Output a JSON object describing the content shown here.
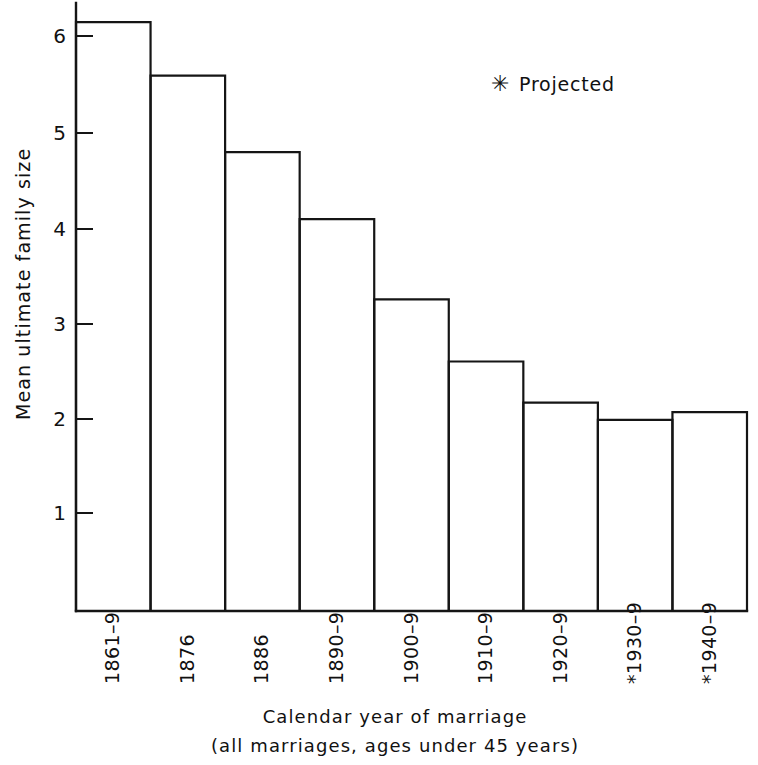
{
  "chart_data": {
    "type": "bar",
    "title": "",
    "xlabel": "Calendar year of marriage",
    "xlabel_sub": "(all marriages, ages under 45 years)",
    "ylabel": "Mean ultimate family size",
    "categories": [
      "1861–9",
      "1876",
      "1886",
      "1890–9",
      "1900–9",
      "1910–9",
      "1920–9",
      "*1930–9",
      "*1940–9"
    ],
    "values": [
      6.16,
      5.6,
      4.8,
      4.1,
      3.26,
      2.61,
      2.18,
      2.0,
      2.08
    ],
    "projected": [
      false,
      false,
      false,
      false,
      false,
      false,
      false,
      true,
      true
    ],
    "ylim": [
      0,
      6.5
    ],
    "yticks": [
      "1",
      "2",
      "3",
      "4",
      "5",
      "6"
    ],
    "ytick_values": [
      1,
      2,
      3,
      4,
      5,
      6
    ],
    "grid": false,
    "legend": {
      "position": "top-right",
      "marker": "asterisk-marker",
      "entries": [
        {
          "symbol": "✳",
          "label": "Projected"
        }
      ]
    },
    "colors": {
      "bar_fill": "#ffffff",
      "bar_stroke": "#151515",
      "axis": "#151515",
      "text": "#111111",
      "background": "#ffffff"
    }
  },
  "legend_symbol": "✳",
  "legend_label": "Projected",
  "star_glyph": "✳"
}
